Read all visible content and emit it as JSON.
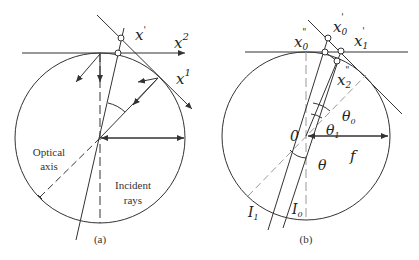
{
  "panels": [
    {
      "id": "a",
      "caption": "(a)",
      "labels": {
        "x_prime": "x",
        "x_prime_sup": "'",
        "x2": "x",
        "x2_sup": "2",
        "x1": "x",
        "x1_sup": "1",
        "optical_axis_line1": "Optical",
        "optical_axis_line2": "axis",
        "incident_line1": "Incident",
        "incident_line2": "rays"
      }
    },
    {
      "id": "b",
      "caption": "(b)",
      "labels": {
        "x0pp": "x",
        "x0pp_sub": "0",
        "x0pp_sup": "\"",
        "x0p": "x",
        "x0p_sub": "0",
        "x0p_sup": "'",
        "x1p": "x",
        "x1p_sub": "1",
        "x1p_sup": "'",
        "x2pp": "x",
        "x2pp_sub": "2",
        "x2pp_sup": "\"",
        "theta0": "θ",
        "theta0_sub": "0",
        "theta1": "θ",
        "theta1_sub": "1",
        "theta": "θ",
        "origin": "0",
        "f": "f",
        "I1": "I",
        "I1_sub": "1",
        "I0": "I",
        "I0_sub": "0"
      }
    }
  ],
  "colors": {
    "line": "#333333",
    "dashed": "#888888",
    "background": "#ffffff"
  }
}
